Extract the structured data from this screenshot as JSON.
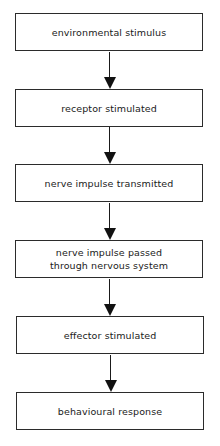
{
  "diagram": {
    "type": "flowchart",
    "direction": "top-to-bottom",
    "nodes": [
      {
        "id": "n1",
        "label": "environmental stimulus"
      },
      {
        "id": "n2",
        "label": "receptor stimulated"
      },
      {
        "id": "n3",
        "label": "nerve impulse transmitted"
      },
      {
        "id": "n4",
        "label": "nerve impulse passed\nthrough nervous system"
      },
      {
        "id": "n5",
        "label": "effector stimulated"
      },
      {
        "id": "n6",
        "label": "behavioural response"
      }
    ],
    "edges": [
      {
        "from": "n1",
        "to": "n2"
      },
      {
        "from": "n2",
        "to": "n3"
      },
      {
        "from": "n3",
        "to": "n4"
      },
      {
        "from": "n4",
        "to": "n5"
      },
      {
        "from": "n5",
        "to": "n6"
      }
    ]
  }
}
